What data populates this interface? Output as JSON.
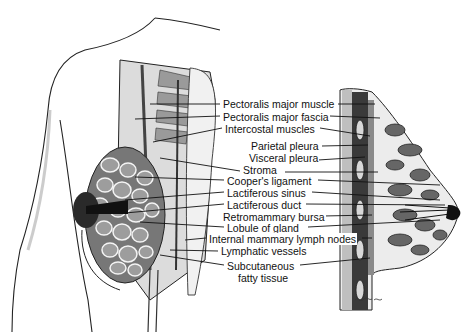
{
  "figure": {
    "labels": [
      {
        "id": "pectoralis-major-muscle",
        "text": "Pectoralis major muscle",
        "x": 222,
        "y": 98
      },
      {
        "id": "pectoralis-major-fascia",
        "text": "Pectoralis major fascia",
        "x": 222,
        "y": 113
      },
      {
        "id": "intercostal-muscles",
        "text": "Intercostal muscles",
        "x": 224,
        "y": 128
      },
      {
        "id": "parietal-pleura",
        "text": "Parietal pleura",
        "x": 250,
        "y": 143
      },
      {
        "id": "visceral-pleura",
        "text": "Visceral pleura",
        "x": 248,
        "y": 157
      },
      {
        "id": "stroma",
        "text": "Stroma",
        "x": 242,
        "y": 171
      },
      {
        "id": "coopers-ligament",
        "text": "Cooper's ligament",
        "x": 226,
        "y": 177
      },
      {
        "id": "lactiferous-sinus",
        "text": "Lactiferous sinus",
        "x": 226,
        "y": 189
      },
      {
        "id": "lactiferous-duct",
        "text": "Lactiferous duct",
        "x": 226,
        "y": 201
      },
      {
        "id": "retromammary-bursa",
        "text": "Retromammary bursa",
        "x": 222,
        "y": 213
      },
      {
        "id": "lobule-of-gland",
        "text": "Lobule of gland",
        "x": 226,
        "y": 224
      },
      {
        "id": "internal-mammary-lymph-nodes",
        "text": "Internal mammary lymph nodes",
        "x": 208,
        "y": 235
      },
      {
        "id": "lymphatic-vessels",
        "text": "Lymphatic vessels",
        "x": 220,
        "y": 248
      },
      {
        "id": "subcutaneous-fatty-tissue-1",
        "text": "Subcutaneous",
        "x": 226,
        "y": 262
      },
      {
        "id": "subcutaneous-fatty-tissue-2",
        "text": "fatty tissue",
        "x": 237,
        "y": 274
      }
    ],
    "colors": {
      "ink": "#111111",
      "shade": "#555555",
      "mid": "#8a8a8a",
      "light": "#c8c8c8",
      "paper": "#ffffff"
    }
  }
}
